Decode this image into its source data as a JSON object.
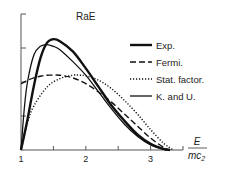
{
  "chart_data": {
    "type": "line",
    "title": "RaE",
    "xlabel_num": "E",
    "xlabel_den": "mc",
    "xlabel_sub": "2",
    "ylabel": "",
    "xlim": [
      1,
      3.5
    ],
    "ylim": [
      0,
      4
    ],
    "xticks": [
      1,
      1.5,
      2,
      2.5,
      3,
      3.5
    ],
    "xtick_labels": [
      "1",
      "",
      "2",
      "",
      "3",
      ""
    ],
    "yticks": [
      1,
      2,
      3,
      4
    ],
    "grid": false,
    "legend_position": "right",
    "series": [
      {
        "name": "Exp.",
        "style": "solid-thick",
        "x": [
          1.0,
          1.1,
          1.2,
          1.3,
          1.4,
          1.5,
          1.6,
          1.8,
          2.0,
          2.2,
          2.4,
          2.6,
          2.8,
          3.0,
          3.2,
          3.3
        ],
        "y": [
          0.0,
          0.9,
          1.9,
          2.7,
          3.15,
          3.26,
          3.2,
          2.9,
          2.4,
          1.85,
          1.3,
          0.85,
          0.45,
          0.18,
          0.03,
          0.0
        ]
      },
      {
        "name": "Fermi.",
        "style": "dashed",
        "x": [
          1.0,
          1.1,
          1.2,
          1.3,
          1.4,
          1.5,
          1.6,
          1.8,
          2.0,
          2.2,
          2.4,
          2.6,
          2.8,
          3.0,
          3.2,
          3.3
        ],
        "y": [
          1.95,
          2.05,
          2.12,
          2.17,
          2.2,
          2.2,
          2.2,
          2.12,
          1.95,
          1.7,
          1.4,
          1.05,
          0.7,
          0.35,
          0.08,
          0.0
        ]
      },
      {
        "name": "Stat. factor.",
        "style": "dotted",
        "x": [
          1.0,
          1.1,
          1.2,
          1.4,
          1.6,
          1.8,
          1.9,
          2.0,
          2.2,
          2.4,
          2.6,
          2.8,
          3.0,
          3.2,
          3.35
        ],
        "y": [
          0.0,
          0.8,
          1.3,
          1.85,
          2.1,
          2.2,
          2.2,
          2.18,
          2.05,
          1.8,
          1.45,
          1.05,
          0.6,
          0.2,
          0.0
        ]
      },
      {
        "name": "K. and U.",
        "style": "solid",
        "x": [
          1.0,
          1.05,
          1.1,
          1.2,
          1.3,
          1.4,
          1.5,
          1.6,
          1.8,
          2.0,
          2.2,
          2.4,
          2.6,
          2.8,
          3.0,
          3.2,
          3.3
        ],
        "y": [
          0.0,
          1.2,
          2.0,
          2.8,
          3.05,
          3.1,
          3.05,
          2.95,
          2.6,
          2.2,
          1.7,
          1.2,
          0.75,
          0.4,
          0.15,
          0.02,
          0.0
        ]
      }
    ]
  }
}
